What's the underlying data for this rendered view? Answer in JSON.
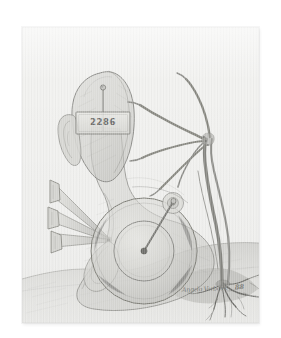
{
  "artwork": {
    "title": "Untitled surrealist pencil drawing",
    "medium": "graphite pencil on paper",
    "paper_color": "#f1f1ef",
    "graphite_color": "#6e6e6b",
    "background_color": "#ffffff"
  },
  "tag": {
    "number": "2286"
  },
  "signature": {
    "name": "Angelo Verbeek",
    "year": "88"
  },
  "elements": {
    "head_bulb": "head-bulb-form",
    "ear": "ear-form",
    "top_pin": "pin-in-head",
    "id_tag": "identification-tag",
    "nails": "three-converging-nails",
    "wheel": "concentric-wheel-disc",
    "wheel_pin": "pin-through-wheel",
    "branch_hand": "branch-hand-with-roots",
    "roots": "root-system",
    "ground": "ground-shading"
  }
}
